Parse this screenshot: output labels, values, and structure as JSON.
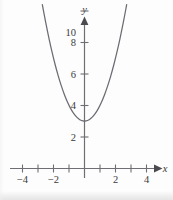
{
  "figure": {
    "background_color": "#fdfdfd",
    "curve_color": "#6b6b72",
    "axis_color": "#6e6e74",
    "label_color": "#3b3b3b"
  },
  "chart_data": {
    "type": "line",
    "title": "",
    "subtitle": "",
    "xlabel": "x",
    "ylabel": "y",
    "equation": "y = x^2 + 3",
    "grid": false,
    "legend": null,
    "xlim": [
      -4.5,
      5.2
    ],
    "ylim": [
      -1.2,
      11.2
    ],
    "x_ticks": [
      -4,
      -3,
      -2,
      -1,
      1,
      2,
      3,
      4
    ],
    "x_tick_labels": [
      "−4",
      "",
      "−2",
      "",
      "",
      "2",
      "",
      "4"
    ],
    "y_ticks": [
      2,
      4,
      6,
      8,
      10
    ],
    "y_tick_labels": [
      "2",
      "4",
      "6",
      "8",
      "10"
    ],
    "vertex": [
      0,
      3
    ],
    "series": [
      {
        "name": "y = x^2 + 3",
        "x": [
          -2.72,
          -2.6,
          -2.4,
          -2.2,
          -2.0,
          -1.8,
          -1.6,
          -1.4,
          -1.2,
          -1.0,
          -0.8,
          -0.6,
          -0.4,
          -0.2,
          0.0,
          0.2,
          0.4,
          0.6,
          0.8,
          1.0,
          1.2,
          1.4,
          1.6,
          1.8,
          2.0,
          2.2,
          2.4,
          2.6,
          2.72
        ],
        "values": [
          10.4,
          9.76,
          8.76,
          7.84,
          7.0,
          6.24,
          5.56,
          4.96,
          4.44,
          4.0,
          3.64,
          3.36,
          3.16,
          3.04,
          3.0,
          3.04,
          3.16,
          3.36,
          3.64,
          4.0,
          4.44,
          4.96,
          5.56,
          6.24,
          7.0,
          7.84,
          8.76,
          9.76,
          10.4
        ]
      }
    ]
  },
  "axes": {
    "x_axis_name": "x",
    "y_axis_name": "y"
  }
}
